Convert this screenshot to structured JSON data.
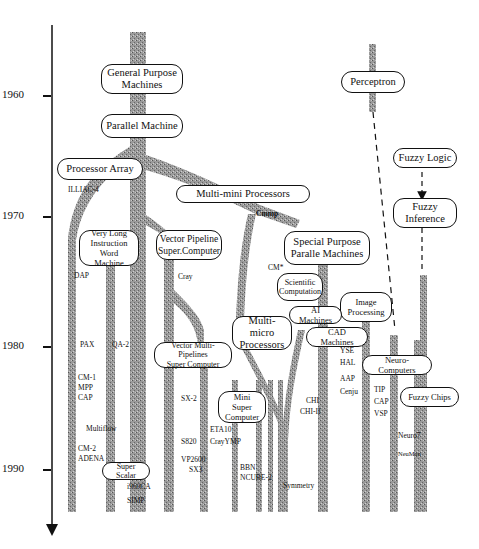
{
  "axis": {
    "years": [
      "1960",
      "1970",
      "1980",
      "1990"
    ],
    "direction": "down"
  },
  "nodes": {
    "general_purpose": "General Purpose\nMachines",
    "parallel_machine": "Parallel Machine",
    "processor_array": "Processor Array",
    "multi_mini": "Multi-mini Processors",
    "vliw": "Very Long\nInstruction Word\nMachine",
    "vector_pipeline": "Vector Pipeline\nSuper.Computer",
    "special_purpose": "Special Purpose\nParalle Machines",
    "scientific": "Scientific\nComputation",
    "ai_machines": "AI Machines",
    "image_processing": "Image\nProcessing",
    "cad_machines": "CAD Machines",
    "multi_micro": "Multi-micro\nProcessors",
    "vector_multi": "Vector Multi-Pipelines\nSuper Computer",
    "mini_super": "Mini Super\nComputer",
    "super_scalar": "Super Scalar",
    "perceptron": "Perceptron",
    "neuro_computers": "Neuro-Computers",
    "fuzzy_logic": "Fuzzy Logic",
    "fuzzy_inference": "Fuzzy\nInference",
    "fuzzy_chips": "Fuzzy Chips"
  },
  "machines": {
    "illiac": "ILLIAC-4",
    "dap": "DAP",
    "pax": "PAX",
    "qa2": "QA-2",
    "cm1": "CM-1",
    "mpp": "MPP",
    "cap": "CAP",
    "multiflow": "Multiflow",
    "cm2": "CM-2",
    "adena": "ADENA",
    "i960ca": "i960CA",
    "simp": "SIMP",
    "cray": "Cray",
    "sx2": "SX-2",
    "s820": "S820",
    "vp2600": "VP2600",
    "sx3": "SX3",
    "eta10": "ETA10",
    "crayymp": "CrayYMP",
    "cmmp": "Cmmp",
    "cmstar": "CM*",
    "bbn": "BBN",
    "ncube2": "NCUBE-2",
    "symmetry": "Symmetry",
    "chi": "CHI",
    "chi2": "CHI-II",
    "yse": "YSE",
    "hal": "HAL",
    "aap": "AAP",
    "cenju": "Cenju",
    "tip": "TIP",
    "cap_neuro": "CAP",
    "vsp": "VSP",
    "neuro7": "Neuro7",
    "neuman": "NeuMan"
  }
}
